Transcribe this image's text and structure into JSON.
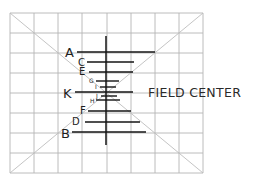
{
  "diagram": {
    "field_center_label": "FIELD CENTER",
    "colors": {
      "grid": "#b4b4b4",
      "diagonals": "#bdbdbd",
      "lines": "#141414",
      "text": "#1e1e1e"
    },
    "grid": {
      "columns": 8,
      "rows": 8,
      "x": [
        10,
        34,
        58,
        82,
        107,
        131,
        155,
        179,
        203
      ],
      "y": [
        13,
        33,
        53,
        73,
        93,
        113,
        133,
        153,
        173
      ]
    },
    "center_vertical_line": {
      "x": 106,
      "y1": 36,
      "y2": 145
    },
    "lines": [
      {
        "label": "A",
        "y": 52,
        "x1": 77,
        "x2": 155,
        "label_x": 65,
        "label_y": 57,
        "size": "big"
      },
      {
        "label": "C",
        "y": 62,
        "x1": 87,
        "x2": 134,
        "label_x": 78,
        "label_y": 66,
        "size": "mid"
      },
      {
        "label": "E",
        "y": 72,
        "x1": 89,
        "x2": 133,
        "label_x": 79,
        "label_y": 75,
        "size": "mid"
      },
      {
        "label": "G",
        "y": 81,
        "x1": 96,
        "x2": 119,
        "label_x": 89,
        "label_y": 83,
        "size": "small"
      },
      {
        "label": "I",
        "y": 87,
        "x1": 100,
        "x2": 116,
        "label_x": 95,
        "label_y": 89,
        "size": "small"
      },
      {
        "label": "K",
        "y": 92,
        "x1": 75,
        "x2": 133,
        "label_x": 63,
        "label_y": 98,
        "size": "big"
      },
      {
        "label": "J",
        "y": 96,
        "x1": 101,
        "x2": 117,
        "label_x": 96,
        "label_y": 98,
        "size": "small"
      },
      {
        "label": "H",
        "y": 100,
        "x1": 96,
        "x2": 120,
        "label_x": 90,
        "label_y": 103,
        "size": "small"
      },
      {
        "label": "F",
        "y": 111,
        "x1": 88,
        "x2": 131,
        "label_x": 80,
        "label_y": 114,
        "size": "mid"
      },
      {
        "label": "D",
        "y": 122,
        "x1": 85,
        "x2": 140,
        "label_x": 72,
        "label_y": 125,
        "size": "mid"
      },
      {
        "label": "B",
        "y": 132,
        "x1": 72,
        "x2": 146,
        "label_x": 61,
        "label_y": 138,
        "size": "big"
      }
    ]
  }
}
